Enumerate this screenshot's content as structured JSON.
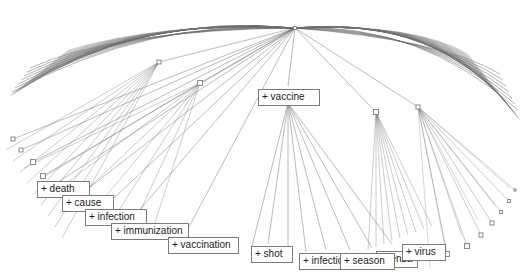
{
  "view": {
    "width": 530,
    "height": 278,
    "background": "#ffffff",
    "edge_color": "#6e6e6e",
    "node_stroke": "#8a8a8a",
    "label_border": "#7a7a7a",
    "label_text_color": "#1a1a1a",
    "type": "hyperbolic-tree"
  },
  "labels": [
    {
      "id": "vaccine",
      "text": "+ vaccine",
      "x": 258,
      "y": 89,
      "w": 62,
      "z": 40
    },
    {
      "id": "death",
      "text": "+ death",
      "x": 37,
      "y": 181,
      "w": 53,
      "z": 31
    },
    {
      "id": "cause",
      "text": "+ cause",
      "x": 62,
      "y": 195,
      "w": 52,
      "z": 32
    },
    {
      "id": "infection1",
      "text": "+ infection",
      "x": 85,
      "y": 209,
      "w": 62,
      "z": 33
    },
    {
      "id": "immunization",
      "text": "+ immunization",
      "x": 111,
      "y": 223,
      "w": 78,
      "z": 34
    },
    {
      "id": "vaccination",
      "text": "+ vaccination",
      "x": 168,
      "y": 237,
      "w": 71,
      "z": 35
    },
    {
      "id": "shot",
      "text": "+ shot",
      "x": 251,
      "y": 246,
      "w": 42,
      "z": 36
    },
    {
      "id": "infection2",
      "text": "+ infection",
      "x": 299,
      "y": 253,
      "w": 62,
      "z": 37
    },
    {
      "id": "season",
      "text": "+ season",
      "x": 340,
      "y": 253,
      "w": 55,
      "z": 38
    },
    {
      "id": "fluenza",
      "text": "fluenza",
      "x": 376,
      "y": 251,
      "w": 42,
      "z": 20
    },
    {
      "id": "virus",
      "text": "+ virus",
      "x": 402,
      "y": 244,
      "w": 44,
      "z": 39
    }
  ],
  "hubs": [
    {
      "id": "root-hub",
      "x": 295,
      "y": 28,
      "size": 3
    },
    {
      "id": "hub-left",
      "x": 159,
      "y": 62,
      "size": 4
    },
    {
      "id": "hub-mid",
      "x": 200,
      "y": 83,
      "size": 5
    },
    {
      "id": "hub-right",
      "x": 376,
      "y": 112,
      "size": 5
    },
    {
      "id": "hub-far",
      "x": 418,
      "y": 107,
      "size": 4
    }
  ],
  "leaf_nodes": [
    {
      "x": 13,
      "y": 139,
      "size": 4
    },
    {
      "x": 21,
      "y": 150,
      "size": 4
    },
    {
      "x": 33,
      "y": 162,
      "size": 5
    },
    {
      "x": 43,
      "y": 176,
      "size": 5
    },
    {
      "x": 447,
      "y": 254,
      "size": 5
    },
    {
      "x": 467,
      "y": 246,
      "size": 5
    },
    {
      "x": 481,
      "y": 235,
      "size": 4
    },
    {
      "x": 492,
      "y": 223,
      "size": 4
    },
    {
      "x": 501,
      "y": 212,
      "size": 3
    },
    {
      "x": 509,
      "y": 201,
      "size": 3
    },
    {
      "x": 515,
      "y": 190,
      "size": 2
    }
  ],
  "arc_description": {
    "label": "dense outer arc of sibling edges",
    "left_end_x": 10,
    "right_end_x": 520,
    "apex_y": 16
  }
}
